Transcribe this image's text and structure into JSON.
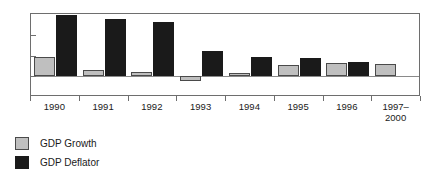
{
  "chart_data": {
    "type": "bar",
    "title": "",
    "subtitle": "",
    "xlabel": "",
    "ylabel": "",
    "categories": [
      "1990",
      "1991",
      "1992",
      "1993",
      "1994",
      "1995",
      "1996",
      "1997–2000"
    ],
    "series": [
      {
        "name": "GDP Growth",
        "color": "#bfbfbf",
        "values": [
          4.6,
          1.6,
          1.1,
          -1.2,
          0.8,
          2.6,
          3.1,
          3.0
        ]
      },
      {
        "name": "GDP Deflator",
        "color": "#1a1a1a",
        "values": [
          14.8,
          13.8,
          13.0,
          6.0,
          4.7,
          4.4,
          3.5,
          null
        ]
      }
    ],
    "ylim": [
      -5,
      15
    ],
    "yticks": [
      -5,
      0,
      5,
      10,
      15
    ],
    "ytick_labels": [
      "−5",
      "0",
      "5",
      "10",
      "15"
    ],
    "grid": false,
    "zero_line": true,
    "legend_position": "below-left",
    "legend": [
      {
        "label": "GDP Growth",
        "color": "#bfbfbf"
      },
      {
        "label": "GDP Deflator",
        "color": "#1a1a1a"
      }
    ]
  }
}
